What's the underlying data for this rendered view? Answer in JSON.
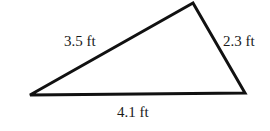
{
  "diagram": {
    "type": "triangle",
    "vertices": {
      "left": [
        30,
        95
      ],
      "top": [
        193,
        3
      ],
      "right": [
        245,
        93
      ]
    },
    "stroke_color": "#111111",
    "sides": [
      {
        "name": "left-side",
        "label": "3.5 ft",
        "x": 64,
        "y": 46
      },
      {
        "name": "right-side",
        "label": "2.3 ft",
        "x": 223,
        "y": 46
      },
      {
        "name": "bottom-side",
        "label": "4.1 ft",
        "x": 117,
        "y": 117
      }
    ]
  }
}
